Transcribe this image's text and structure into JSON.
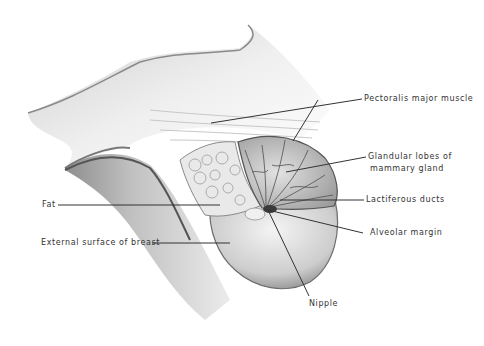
{
  "diagram": {
    "colors": {
      "background": "#ffffff",
      "ink": "#333333",
      "shade_dark": "#6e6e6e",
      "shade_mid": "#a8a8a8",
      "shade_light": "#d6d6d6"
    },
    "labels": {
      "pectoralis": "Pectoralis major muscle",
      "glandular_line1": "Glandular lobes of",
      "glandular_line2": "mammary gland",
      "lactiferous": "Lactiferous ducts",
      "alveolar": "Alveolar margin",
      "fat": "Fat",
      "external": "External surface of breast",
      "nipple": "Nipple"
    }
  }
}
